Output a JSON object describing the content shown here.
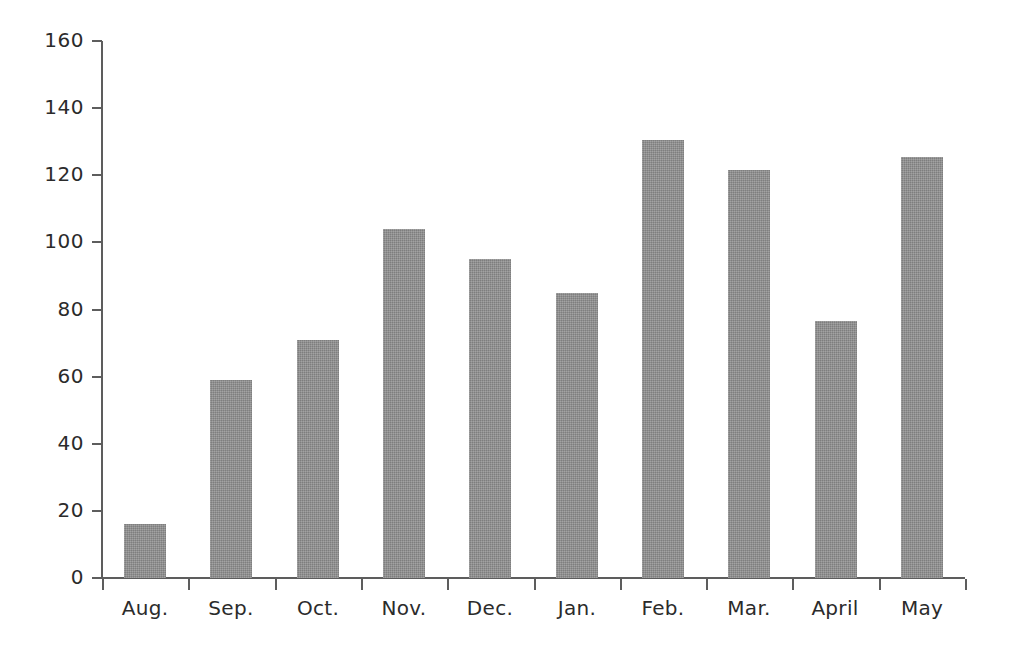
{
  "chart_data": {
    "type": "bar",
    "title": "",
    "subtitle": "",
    "xlabel": "",
    "ylabel": "",
    "categories": [
      "Aug.",
      "Sep.",
      "Oct.",
      "Nov.",
      "Dec.",
      "Jan.",
      "Feb.",
      "Mar.",
      "April",
      "May"
    ],
    "values": [
      16,
      59,
      71,
      104,
      95,
      85,
      130.5,
      121.5,
      76.5,
      125.5
    ],
    "ylim": [
      0,
      160
    ],
    "ytick_values": [
      0,
      20,
      40,
      60,
      80,
      100,
      120,
      140,
      160
    ],
    "ytick_labels": [
      "0",
      "20",
      "40",
      "60",
      "80",
      "100",
      "120",
      "140",
      "160"
    ],
    "grid": false,
    "legend": null,
    "legend_position": "none",
    "bar_color": "#8c8c8c",
    "axis_color": "#5d5d5d",
    "text_color": "#2b2b2b",
    "background_color": "#ffffff",
    "annotations": []
  }
}
